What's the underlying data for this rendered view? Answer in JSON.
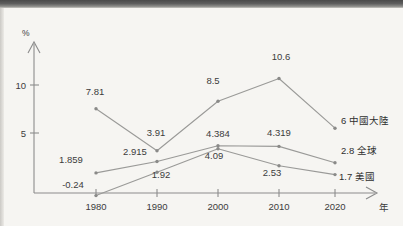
{
  "chart_data": {
    "type": "line",
    "title": "",
    "xlabel": "年",
    "ylabel": "%",
    "categories": [
      "1980",
      "1990",
      "2000",
      "2010",
      "2020"
    ],
    "x": [
      1980,
      1990,
      2000,
      2010,
      2020
    ],
    "ylim": [
      -1,
      12
    ],
    "yticks": [
      5,
      10
    ],
    "ytick_labels": [
      "5",
      "10"
    ],
    "grid": false,
    "legend_position": "right-inline",
    "series": [
      {
        "name": "中國大陸",
        "values": [
          7.81,
          3.91,
          8.5,
          10.6,
          6
        ],
        "labels": [
          "7.81",
          "3.91",
          "8.5",
          "10.6",
          "6"
        ],
        "end_label": "6 中國大陸",
        "color": "#9a9a98"
      },
      {
        "name": "全球",
        "values": [
          1.859,
          2.915,
          4.384,
          4.319,
          2.8
        ],
        "labels": [
          "1.859",
          "2.915",
          "4.384",
          "4.319",
          "2.8"
        ],
        "end_label": "2.8 全球",
        "color": "#9a9a98"
      },
      {
        "name": "美國",
        "values": [
          -0.24,
          1.92,
          4.09,
          2.53,
          1.7
        ],
        "labels": [
          "-0.24",
          "1.92",
          "4.09",
          "2.53",
          "1.7"
        ],
        "end_label": "1.7 美國",
        "color": "#9a9a98"
      }
    ]
  },
  "axes": {
    "y_unit": "%",
    "x_unit": "年",
    "y_tick_10": "10",
    "y_tick_5": "5"
  },
  "x_labels": {
    "t1980": "1980",
    "t1990": "1990",
    "t2000": "2000",
    "t2010": "2010",
    "t2020": "2020"
  },
  "point_labels": {
    "china": {
      "p1980": "7.81",
      "p1990": "3.91",
      "p2000": "8.5",
      "p2010": "10.6",
      "p2020": "6"
    },
    "global": {
      "p1980": "1.859",
      "p1990": "2.915",
      "p2000": "4.384",
      "p2010": "4.319",
      "p2020": "2.8"
    },
    "usa": {
      "p1980": "-0.24",
      "p1990": "1.92",
      "p2000": "4.09",
      "p2010": "2.53",
      "p2020": "1.7"
    }
  },
  "series_end_labels": {
    "china": "6 中國大陸",
    "global": "2.8 全球",
    "usa": "1.7 美國"
  },
  "colors": {
    "background": "#f6f5f2",
    "line": "#9a9a98",
    "axis": "#8c8c8c",
    "text": "#3c3c3c"
  }
}
